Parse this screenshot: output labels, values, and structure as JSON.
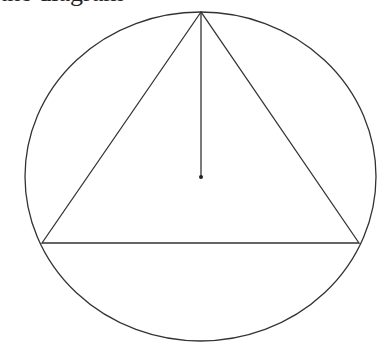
{
  "caption": {
    "text": "the diagram"
  },
  "diagram": {
    "stroke_color": "#333333",
    "circle": {
      "cx": 200.5,
      "cy": 176.5,
      "rx": 175.5,
      "ry": 164.5
    },
    "triangle": {
      "vertices": [
        {
          "name": "top",
          "x": 201,
          "y": 12
        },
        {
          "name": "bottom-left",
          "x": 42,
          "y": 243
        },
        {
          "name": "bottom-right",
          "x": 359,
          "y": 243
        }
      ]
    },
    "radius_segment": {
      "x1": 201,
      "y1": 12,
      "x2": 201,
      "y2": 177
    },
    "center_point": {
      "x": 201,
      "y": 177,
      "r": 2
    }
  }
}
